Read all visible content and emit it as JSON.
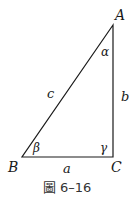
{
  "figure": {
    "caption": "圖 6–16",
    "vertices": {
      "A": {
        "label": "A",
        "x": 113,
        "y": 25
      },
      "B": {
        "label": "B",
        "x": 22,
        "y": 157
      },
      "C": {
        "label": "C",
        "x": 113,
        "y": 157
      }
    },
    "sides": {
      "a": {
        "label": "a",
        "between": [
          "B",
          "C"
        ]
      },
      "b": {
        "label": "b",
        "between": [
          "A",
          "C"
        ]
      },
      "c": {
        "label": "c",
        "between": [
          "A",
          "B"
        ]
      }
    },
    "angles": {
      "alpha": {
        "label": "α",
        "at": "A"
      },
      "beta": {
        "label": "β",
        "at": "B"
      },
      "gamma": {
        "label": "γ",
        "at": "C"
      }
    },
    "colors": {
      "stroke": "#1a1a1a",
      "text": "#1a1a1a",
      "caption": "#333333",
      "background": "#ffffff"
    }
  }
}
